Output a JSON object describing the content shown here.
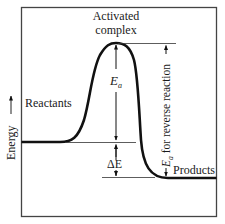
{
  "diagram": {
    "y_axis_label": "Energy",
    "labels": {
      "activated_complex_line1": "Activated",
      "activated_complex_line2": "complex",
      "reactants": "Reactants",
      "products": "Products",
      "ea_forward": "E",
      "ea_forward_sub": "a",
      "delta_e": "ΔE",
      "ea_reverse_symbol": "E",
      "ea_reverse_sub": "a",
      "ea_reverse_text": " for reverse reaction"
    },
    "levels": {
      "reactants_y": 142,
      "peak_y": 43,
      "products_y": 178
    },
    "colors": {
      "line": "#111111",
      "thin_line": "#333333",
      "frame": "#444444"
    }
  }
}
